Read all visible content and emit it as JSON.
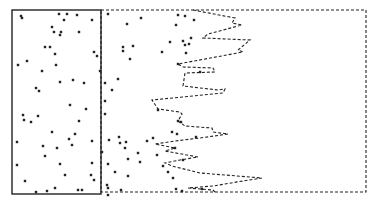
{
  "figure": {
    "width": 376,
    "height": 202,
    "background": "#ffffff",
    "ink_color": "#222222",
    "solid_box": {
      "x": 12,
      "y": 10,
      "w": 89,
      "h": 184
    },
    "dashed_box": {
      "x": 101,
      "y": 10,
      "w": 265,
      "h": 182
    },
    "boundary_line": [
      [
        193,
        10
      ],
      [
        235,
        18
      ],
      [
        232,
        23
      ],
      [
        242,
        25
      ],
      [
        208,
        34
      ],
      [
        203,
        38
      ],
      [
        250,
        40
      ],
      [
        238,
        50
      ],
      [
        243,
        52
      ],
      [
        178,
        64
      ],
      [
        183,
        67
      ],
      [
        213,
        68
      ],
      [
        215,
        72
      ],
      [
        185,
        73
      ],
      [
        183,
        86
      ],
      [
        218,
        90
      ],
      [
        225,
        89
      ],
      [
        223,
        93
      ],
      [
        152,
        100
      ],
      [
        158,
        109
      ],
      [
        180,
        112
      ],
      [
        182,
        114
      ],
      [
        178,
        121
      ],
      [
        185,
        126
      ],
      [
        212,
        128
      ],
      [
        213,
        132
      ],
      [
        228,
        134
      ],
      [
        200,
        138
      ],
      [
        175,
        141
      ],
      [
        155,
        144
      ],
      [
        175,
        148
      ],
      [
        165,
        151
      ],
      [
        198,
        157
      ],
      [
        180,
        160
      ],
      [
        165,
        163
      ],
      [
        172,
        166
      ],
      [
        200,
        173
      ],
      [
        262,
        178
      ],
      [
        243,
        181
      ],
      [
        213,
        186
      ],
      [
        188,
        188
      ],
      [
        213,
        190
      ],
      [
        215,
        192
      ]
    ],
    "points_solid_region": [
      [
        21,
        16
      ],
      [
        22,
        18
      ],
      [
        59,
        14
      ],
      [
        67,
        14
      ],
      [
        77,
        15
      ],
      [
        64,
        20
      ],
      [
        92,
        20
      ],
      [
        52,
        27
      ],
      [
        54,
        32
      ],
      [
        61,
        32
      ],
      [
        60,
        35
      ],
      [
        79,
        32
      ],
      [
        45,
        47
      ],
      [
        50,
        47
      ],
      [
        55,
        54
      ],
      [
        94,
        52
      ],
      [
        97,
        56
      ],
      [
        18,
        65
      ],
      [
        27,
        61
      ],
      [
        56,
        65
      ],
      [
        42,
        71
      ],
      [
        100,
        71
      ],
      [
        60,
        82
      ],
      [
        73,
        80
      ],
      [
        84,
        83
      ],
      [
        36,
        88
      ],
      [
        39,
        91
      ],
      [
        105,
        83
      ],
      [
        70,
        105
      ],
      [
        86,
        109
      ],
      [
        23,
        115
      ],
      [
        24,
        120
      ],
      [
        31,
        122
      ],
      [
        38,
        116
      ],
      [
        79,
        121
      ],
      [
        52,
        132
      ],
      [
        75,
        134
      ],
      [
        69,
        139
      ],
      [
        92,
        141
      ],
      [
        17,
        142
      ],
      [
        43,
        146
      ],
      [
        57,
        148
      ],
      [
        72,
        145
      ],
      [
        45,
        156
      ],
      [
        102,
        152
      ],
      [
        17,
        165
      ],
      [
        60,
        164
      ],
      [
        92,
        163
      ],
      [
        65,
        175
      ],
      [
        91,
        175
      ],
      [
        94,
        180
      ],
      [
        25,
        181
      ],
      [
        36,
        192
      ],
      [
        47,
        191
      ],
      [
        55,
        188
      ],
      [
        78,
        190
      ],
      [
        82,
        190
      ]
    ],
    "points_dashed_region": [
      [
        108,
        14
      ],
      [
        127,
        24
      ],
      [
        141,
        18
      ],
      [
        178,
        15
      ],
      [
        185,
        16
      ],
      [
        194,
        20
      ],
      [
        123,
        47
      ],
      [
        123,
        51
      ],
      [
        133,
        46
      ],
      [
        130,
        59
      ],
      [
        162,
        52
      ],
      [
        170,
        42
      ],
      [
        183,
        41
      ],
      [
        185,
        45
      ],
      [
        176,
        25
      ],
      [
        191,
        38
      ],
      [
        189,
        44
      ],
      [
        186,
        53
      ],
      [
        178,
        64
      ],
      [
        200,
        72
      ],
      [
        118,
        79
      ],
      [
        112,
        90
      ],
      [
        105,
        114
      ],
      [
        105,
        101
      ],
      [
        119,
        137
      ],
      [
        120,
        143
      ],
      [
        125,
        148
      ],
      [
        126,
        142
      ],
      [
        147,
        141
      ],
      [
        138,
        153
      ],
      [
        128,
        159
      ],
      [
        140,
        162
      ],
      [
        157,
        155
      ],
      [
        163,
        166
      ],
      [
        183,
        160
      ],
      [
        128,
        176
      ],
      [
        115,
        172
      ],
      [
        107,
        185
      ],
      [
        121,
        190
      ],
      [
        108,
        195
      ],
      [
        109,
        140
      ],
      [
        108,
        164
      ],
      [
        108,
        188
      ],
      [
        178,
        121
      ],
      [
        181,
        122
      ],
      [
        177,
        134
      ],
      [
        175,
        148
      ],
      [
        153,
        138
      ],
      [
        158,
        110
      ],
      [
        172,
        132
      ],
      [
        196,
        137
      ],
      [
        168,
        172
      ],
      [
        173,
        178
      ],
      [
        182,
        191
      ],
      [
        176,
        189
      ],
      [
        202,
        189
      ]
    ]
  }
}
